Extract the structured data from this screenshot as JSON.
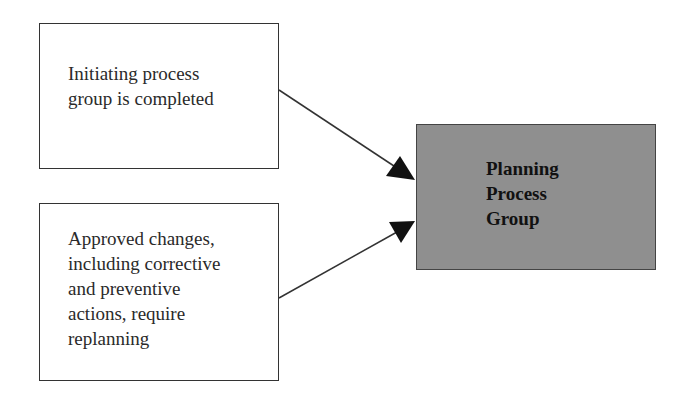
{
  "diagram": {
    "type": "flow",
    "nodes": [
      {
        "id": "initiating",
        "label": "Initiating process\ngroup is completed",
        "fill": "#ffffff"
      },
      {
        "id": "approved_changes",
        "label": "Approved changes,\nincluding corrective\nand preventive\nactions, require\nreplanning",
        "fill": "#ffffff"
      },
      {
        "id": "planning",
        "label": "Planning\nProcess\nGroup",
        "fill": "#8f8f8f"
      }
    ],
    "edges": [
      {
        "from": "initiating",
        "to": "planning"
      },
      {
        "from": "approved_changes",
        "to": "planning"
      }
    ]
  }
}
